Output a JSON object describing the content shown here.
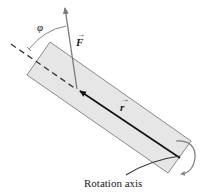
{
  "diagram": {
    "type": "torque-on-rod",
    "labels": {
      "angle": "φ",
      "force": "F",
      "position": "r",
      "vector_arrow": "→",
      "rotation_axis": "Rotation axis"
    },
    "colors": {
      "rod_fill": "#e6e6e6",
      "rod_stroke": "#8a8a8a",
      "force_arrow": "#7a7a7a",
      "position_arrow": "#111111",
      "dashed_line": "#333333",
      "arc": "#8a8a8a",
      "rotation_arrow": "#7a7a7a",
      "text": "#1a1a1a"
    }
  }
}
